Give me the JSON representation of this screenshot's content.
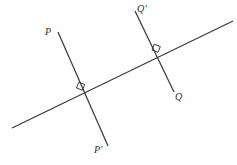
{
  "figure": {
    "background_color": "#ffffff",
    "line_color": "#3b3b3b",
    "label_color": "#2e2e2e",
    "width": 237,
    "height": 165,
    "labels": {
      "p": "P",
      "p_prime": "P'",
      "q_prime": "Q'",
      "q": "Q"
    },
    "lines": {
      "transversal": {
        "name": "transversal-line",
        "x1": 12,
        "y1": 128,
        "x2": 233,
        "y2": 21
      },
      "pp_prime": {
        "name": "line-P-P-prime",
        "x1": 58,
        "y1": 32,
        "x2": 108,
        "y2": 146
      },
      "qq_prime": {
        "name": "line-Q-prime-Q",
        "x1": 135,
        "y1": 11,
        "x2": 174,
        "y2": 92
      }
    },
    "intersections": {
      "left": {
        "x": 82,
        "y": 90,
        "angle": "90"
      },
      "right": {
        "x": 158,
        "y": 52,
        "angle": "90"
      }
    },
    "right_angle_marks": {
      "left": {
        "points": "76.5,88.0 78.8,82.2 84.8,84.5 82.5,90.2"
      },
      "right": {
        "points": "152.0,50.0 154.3,44.2 160.3,46.5 158.0,52.3"
      }
    }
  }
}
